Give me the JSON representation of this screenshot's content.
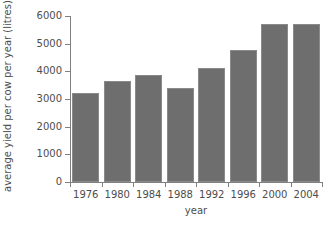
{
  "chart_data": {
    "type": "bar",
    "title": "",
    "xlabel": "year",
    "ylabel": "average yield per cow per year (litres)",
    "categories": [
      "1976",
      "1980",
      "1984",
      "1988",
      "1992",
      "1996",
      "2000",
      "2004"
    ],
    "values": [
      3200,
      3650,
      3850,
      3400,
      4130,
      4780,
      5720,
      5720
    ],
    "ylim": [
      0,
      6000
    ],
    "ytick_labels": [
      "0",
      "1000",
      "2000",
      "3000",
      "4000",
      "5000",
      "6000"
    ],
    "ytick_values": [
      0,
      1000,
      2000,
      3000,
      4000,
      5000,
      6000
    ],
    "grid": false,
    "legend": "none",
    "bar_color": "#6e6e6e",
    "bar_edge_color": "#8a8a8a",
    "axis_color": "#808080",
    "text_color": "#4d4d4d",
    "background_color": "#ffffff"
  }
}
